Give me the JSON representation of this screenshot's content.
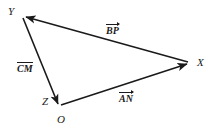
{
  "diagram": {
    "type": "vector-triangle",
    "background_color": "#ffffff",
    "stroke_color": "#1a1a1a",
    "width": 213,
    "height": 134,
    "points": [
      {
        "id": "Y",
        "label": "Y",
        "x": 22,
        "y": 15,
        "label_x": 8,
        "label_y": 6
      },
      {
        "id": "X",
        "label": "X",
        "x": 190,
        "y": 63,
        "label_x": 197,
        "label_y": 57
      },
      {
        "id": "O",
        "label": "O",
        "x": 60,
        "y": 106,
        "label_x": 57,
        "label_y": 114
      },
      {
        "id": "Z",
        "label": "Z",
        "x": 54,
        "y": 101,
        "label_x": 42,
        "label_y": 96
      }
    ],
    "vectors": [
      {
        "id": "BP",
        "label": "BP",
        "notation": "arrow",
        "from": "X",
        "to": "Y",
        "label_x": 106,
        "label_y": 25
      },
      {
        "id": "CM",
        "label": "CM",
        "notation": "bar",
        "from": "Y",
        "to": "O",
        "label_x": 17,
        "label_y": 63
      },
      {
        "id": "AN",
        "label": "AN",
        "notation": "arrow",
        "from": "O",
        "to": "X",
        "label_x": 119,
        "label_y": 93
      }
    ]
  }
}
